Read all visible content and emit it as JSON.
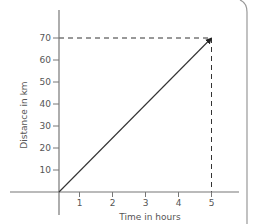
{
  "chart_data": {
    "type": "line",
    "title": "",
    "xlabel": "Time in hours",
    "ylabel": "Distance in km",
    "x": [
      0,
      5
    ],
    "series": [
      {
        "name": "distance",
        "values": [
          0,
          70
        ]
      }
    ],
    "xticks": [
      1,
      2,
      3,
      4,
      5
    ],
    "yticks": [
      10,
      20,
      30,
      40,
      50,
      60,
      70
    ],
    "xlim": [
      0,
      5
    ],
    "ylim": [
      0,
      70
    ],
    "grid": false,
    "legend": "none",
    "annotations": [
      {
        "type": "dashed-guide",
        "from": [
          0,
          70
        ],
        "to": [
          5,
          70
        ]
      },
      {
        "type": "dashed-guide",
        "from": [
          5,
          70
        ],
        "to": [
          5,
          0
        ]
      },
      {
        "type": "arrowhead",
        "at": [
          5,
          70
        ]
      }
    ]
  },
  "colors": {
    "axis": "#777777",
    "line": "#333333",
    "dash": "#333333",
    "text": "#555555",
    "frame": "#999999"
  }
}
